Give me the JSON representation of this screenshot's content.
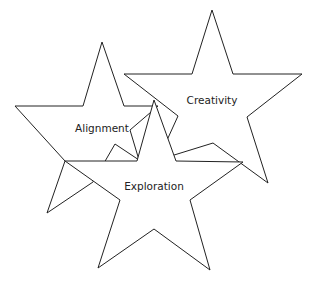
{
  "diagram": {
    "stars": [
      {
        "id": "alignment",
        "label": "Alignment",
        "label_x": 102,
        "label_y": 132,
        "points": "102,42 124,106 158,106 130,130 139,160 115,144 93,182 47,213 65,161 15,106 83,106"
      },
      {
        "id": "creativity",
        "label": "Creativity",
        "label_x": 212,
        "label_y": 104,
        "points": "212,10 233,74 302,74 247,117 268,183 213,143 158,160 178,116 124,74 192,74"
      },
      {
        "id": "exploration",
        "label": "Exploration",
        "label_x": 154,
        "label_y": 190,
        "points": "154,100 176,161 243,162 190,200 210,270 154,229 98,268 120,200 65,161 137,161"
      }
    ]
  }
}
